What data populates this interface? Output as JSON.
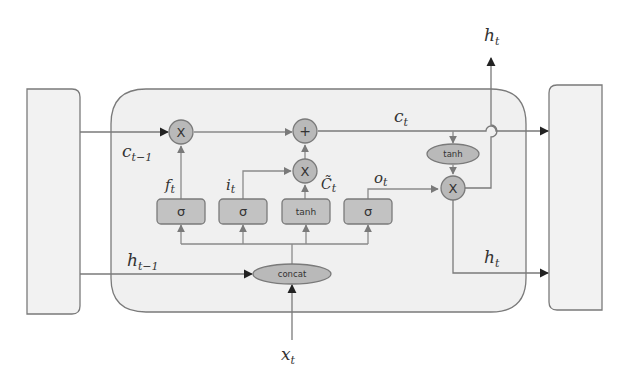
{
  "diagram": {
    "type": "LSTM cell",
    "colors": {
      "background": "#ffffff",
      "cell_fill": "#f0f0f0",
      "stroke": "#7a7a7a",
      "node_fill": "#b9b9b9",
      "arrow": "#333333"
    },
    "labels": {
      "c_prev": {
        "base": "c",
        "sub": "t−1"
      },
      "h_prev": {
        "base": "h",
        "sub": "t−1"
      },
      "c_t": {
        "base": "c",
        "sub": "t"
      },
      "h_t_top": {
        "base": "h",
        "sub": "t"
      },
      "h_t_right": {
        "base": "h",
        "sub": "t"
      },
      "x_t": {
        "base": "x",
        "sub": "t"
      },
      "f_t": {
        "base": "f",
        "sub": "t"
      },
      "i_t": {
        "base": "i",
        "sub": "t"
      },
      "c_tilde": {
        "base": "C̃",
        "sub": "t"
      },
      "o_t": {
        "base": "o",
        "sub": "t"
      }
    },
    "gates": [
      {
        "id": "forget",
        "op": "σ"
      },
      {
        "id": "input",
        "op": "σ"
      },
      {
        "id": "candidate",
        "op": "tanh"
      },
      {
        "id": "output",
        "op": "σ"
      }
    ],
    "ops": {
      "mul_forget": "X",
      "add_cell": "+",
      "mul_input": "X",
      "tanh_cell": "tanh",
      "mul_output": "X",
      "concat": "concat"
    }
  }
}
